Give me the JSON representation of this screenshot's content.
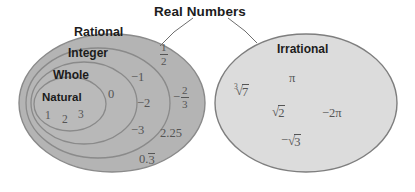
{
  "title": {
    "text": "Real Numbers"
  },
  "sets": {
    "rational": {
      "label": "Rational",
      "fill": "#b4b4b4",
      "stroke": "#8a8a8a",
      "members": [
        {
          "display": "1/2",
          "kind": "fraction",
          "numerator": "1",
          "denominator": "2",
          "sign": ""
        },
        {
          "display": "-2/3",
          "kind": "fraction",
          "numerator": "2",
          "denominator": "3",
          "sign": "−"
        },
        {
          "display": "2.25",
          "kind": "plain"
        },
        {
          "display": "0.3̅",
          "kind": "repeating-decimal",
          "prefix": "0.",
          "repeat": "3"
        }
      ]
    },
    "integer": {
      "label": "Integer",
      "fill": "#b6b6b6",
      "stroke": "#8a8a8a",
      "members": [
        {
          "display": "−1",
          "kind": "plain"
        },
        {
          "display": "−2",
          "kind": "plain"
        },
        {
          "display": "−3",
          "kind": "plain"
        }
      ]
    },
    "whole": {
      "label": "Whole",
      "fill": "#b8b8b8",
      "stroke": "#8a8a8a",
      "members": [
        {
          "display": "0",
          "kind": "plain"
        }
      ]
    },
    "natural": {
      "label": "Natural",
      "fill": "#bababa",
      "stroke": "#8a8a8a",
      "members": [
        {
          "display": "1",
          "kind": "plain"
        },
        {
          "display": "2",
          "kind": "plain"
        },
        {
          "display": "3",
          "kind": "plain"
        }
      ]
    },
    "irrational": {
      "label": "Irrational",
      "fill": "#dcdcdc",
      "stroke": "#7e7e7e",
      "members": [
        {
          "display": "∛7",
          "kind": "radical",
          "index": "3",
          "radicand": "7",
          "sign": ""
        },
        {
          "display": "π",
          "kind": "plain"
        },
        {
          "display": "√2",
          "kind": "radical",
          "index": "",
          "radicand": "2",
          "sign": ""
        },
        {
          "display": "−2π",
          "kind": "plain"
        },
        {
          "display": "−√3",
          "kind": "radical",
          "index": "",
          "radicand": "3",
          "sign": "−"
        }
      ]
    }
  },
  "leader_lines": {
    "left_label": "leader-to-rational",
    "right_label": "leader-to-irrational"
  },
  "colors": {
    "background": "#ffffff",
    "text_dark": "#1c1c1c",
    "text_member": "#555555"
  }
}
